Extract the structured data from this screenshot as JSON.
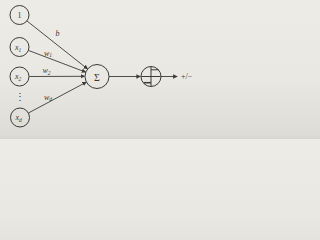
{
  "colors": {
    "paper": "#eae8e2",
    "ink": "#3a3a38"
  },
  "diagram": {
    "type": "perceptron-unit",
    "nodes": {
      "bias": {
        "label": "1"
      },
      "x1": {
        "base": "x",
        "sub": "1"
      },
      "x2": {
        "base": "x",
        "sub": "2"
      },
      "xd": {
        "base": "x",
        "sub": "d"
      },
      "ellipsis": "⋮",
      "sum": {
        "label": "Σ"
      },
      "threshold": {
        "glyph": "sign-step-function"
      }
    },
    "weights": {
      "b": {
        "label": "b"
      },
      "w1": {
        "base": "w",
        "sub": "1"
      },
      "w2": {
        "base": "w",
        "sub": "2"
      },
      "wd": {
        "base": "w",
        "sub": "d"
      }
    },
    "output": {
      "label": "+/−"
    }
  }
}
